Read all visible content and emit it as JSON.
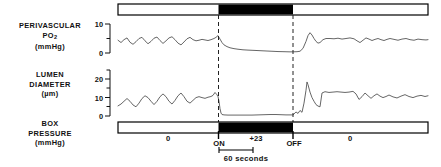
{
  "figure": {
    "type": "multi-panel-physiological-recording",
    "width": 441,
    "height": 167,
    "background": "#ffffff",
    "trace_color": "#555555",
    "bar_fill_on": "#000000",
    "bar_fill_off": "#ffffff",
    "bar_stroke": "#000000"
  },
  "panels": {
    "po2": {
      "label_line1": "PERIVASCULAR",
      "label_line2_main": "PO",
      "label_line2_sub": "2",
      "label_line3": "(mmHg)",
      "axis_ticks": [
        "10",
        "0"
      ],
      "axis_max": 10,
      "axis_min": 0
    },
    "lumen": {
      "label_line1": "LUMEN",
      "label_line2": "DIAMETER",
      "label_line3": "(µm)",
      "axis_ticks": [
        "20",
        "10",
        "0"
      ],
      "axis_max": 25,
      "axis_min": 0
    },
    "box": {
      "label_line1": "BOX",
      "label_line2": "PRESSURE",
      "label_line3": "(mmHg)",
      "segment_values": [
        "0",
        "+23",
        "0"
      ]
    }
  },
  "markers": {
    "on_label": "ON",
    "off_label": "OFF",
    "scale_label": "60  seconds"
  },
  "chart_data": {
    "type": "line",
    "title": "",
    "xlabel": "time",
    "ylabel": "",
    "grid": false,
    "legend": "none",
    "event_on_x": 218,
    "event_off_x": 293,
    "plot_x_start": 118,
    "plot_x_end": 428,
    "series": [
      {
        "name": "Perivascular PO2 (mmHg)",
        "ylim": [
          0,
          10
        ],
        "ytick_values": [
          0,
          10
        ],
        "points": [
          [
            118,
            4.4
          ],
          [
            121,
            3.6
          ],
          [
            124,
            4.6
          ],
          [
            127,
            5.2
          ],
          [
            130,
            3.7
          ],
          [
            133,
            3.0
          ],
          [
            136,
            3.9
          ],
          [
            139,
            5.0
          ],
          [
            142,
            5.4
          ],
          [
            145,
            4.2
          ],
          [
            148,
            3.2
          ],
          [
            151,
            4.0
          ],
          [
            154,
            5.1
          ],
          [
            157,
            5.5
          ],
          [
            160,
            4.3
          ],
          [
            163,
            3.3
          ],
          [
            166,
            4.2
          ],
          [
            169,
            5.2
          ],
          [
            172,
            5.6
          ],
          [
            175,
            4.6
          ],
          [
            178,
            3.4
          ],
          [
            181,
            2.8
          ],
          [
            184,
            3.8
          ],
          [
            187,
            4.9
          ],
          [
            190,
            5.4
          ],
          [
            193,
            4.6
          ],
          [
            196,
            4.2
          ],
          [
            199,
            4.4
          ],
          [
            202,
            4.7
          ],
          [
            205,
            4.5
          ],
          [
            208,
            4.3
          ],
          [
            211,
            4.6
          ],
          [
            214,
            5.0
          ],
          [
            216,
            5.4
          ],
          [
            218,
            6.0
          ],
          [
            220,
            4.8
          ],
          [
            222,
            3.6
          ],
          [
            224,
            2.8
          ],
          [
            227,
            2.2
          ],
          [
            230,
            1.8
          ],
          [
            234,
            1.5
          ],
          [
            238,
            1.3
          ],
          [
            243,
            1.1
          ],
          [
            248,
            1.0
          ],
          [
            254,
            0.9
          ],
          [
            260,
            0.8
          ],
          [
            266,
            0.7
          ],
          [
            272,
            0.6
          ],
          [
            278,
            0.5
          ],
          [
            284,
            0.45
          ],
          [
            289,
            0.4
          ],
          [
            293,
            0.4
          ],
          [
            297,
            0.45
          ],
          [
            300,
            0.6
          ],
          [
            303,
            1.6
          ],
          [
            306,
            4.0
          ],
          [
            308,
            6.0
          ],
          [
            310,
            7.0
          ],
          [
            312,
            6.2
          ],
          [
            314,
            5.0
          ],
          [
            316,
            4.0
          ],
          [
            318,
            3.4
          ],
          [
            320,
            3.6
          ],
          [
            323,
            4.6
          ],
          [
            326,
            5.0
          ],
          [
            330,
            5.0
          ],
          [
            334,
            4.9
          ],
          [
            338,
            5.1
          ],
          [
            342,
            4.8
          ],
          [
            346,
            5.0
          ],
          [
            350,
            5.2
          ],
          [
            354,
            4.9
          ],
          [
            357,
            4.2
          ],
          [
            360,
            3.6
          ],
          [
            363,
            4.4
          ],
          [
            366,
            5.2
          ],
          [
            369,
            4.8
          ],
          [
            372,
            4.3
          ],
          [
            375,
            4.7
          ],
          [
            378,
            5.0
          ],
          [
            381,
            4.6
          ],
          [
            384,
            4.3
          ],
          [
            387,
            4.7
          ],
          [
            390,
            5.0
          ],
          [
            394,
            4.7
          ],
          [
            398,
            4.4
          ],
          [
            402,
            4.8
          ],
          [
            406,
            5.0
          ],
          [
            410,
            4.6
          ],
          [
            414,
            4.4
          ],
          [
            418,
            4.8
          ],
          [
            422,
            4.6
          ],
          [
            426,
            4.5
          ],
          [
            428,
            4.6
          ]
        ]
      },
      {
        "name": "Lumen Diameter (µm)",
        "ylim": [
          0,
          25
        ],
        "ytick_values": [
          0,
          10,
          20
        ],
        "points": [
          [
            118,
            5.5
          ],
          [
            121,
            6.5
          ],
          [
            124,
            8.0
          ],
          [
            127,
            9.5
          ],
          [
            130,
            8.0
          ],
          [
            133,
            6.0
          ],
          [
            136,
            5.0
          ],
          [
            139,
            7.0
          ],
          [
            142,
            9.5
          ],
          [
            145,
            11.0
          ],
          [
            148,
            10.0
          ],
          [
            151,
            8.0
          ],
          [
            154,
            6.2
          ],
          [
            157,
            8.0
          ],
          [
            160,
            10.5
          ],
          [
            163,
            12.0
          ],
          [
            166,
            10.5
          ],
          [
            169,
            8.0
          ],
          [
            172,
            6.5
          ],
          [
            175,
            8.5
          ],
          [
            178,
            11.0
          ],
          [
            181,
            12.5
          ],
          [
            184,
            10.5
          ],
          [
            187,
            8.0
          ],
          [
            190,
            7.0
          ],
          [
            193,
            8.5
          ],
          [
            196,
            10.0
          ],
          [
            199,
            10.5
          ],
          [
            202,
            10.0
          ],
          [
            205,
            9.6
          ],
          [
            208,
            10.2
          ],
          [
            211,
            10.6
          ],
          [
            213,
            11.2
          ],
          [
            215,
            12.8
          ],
          [
            217,
            11.5
          ],
          [
            218,
            10.5
          ],
          [
            219,
            8.0
          ],
          [
            220,
            4.0
          ],
          [
            221,
            1.6
          ],
          [
            222,
            0.8
          ],
          [
            224,
            0.6
          ],
          [
            228,
            0.5
          ],
          [
            233,
            0.5
          ],
          [
            239,
            0.5
          ],
          [
            245,
            0.5
          ],
          [
            252,
            0.5
          ],
          [
            258,
            0.6
          ],
          [
            264,
            0.7
          ],
          [
            270,
            0.8
          ],
          [
            276,
            0.8
          ],
          [
            281,
            0.7
          ],
          [
            286,
            0.6
          ],
          [
            290,
            0.6
          ],
          [
            293,
            0.6
          ],
          [
            296,
            2.2
          ],
          [
            298,
            1.4
          ],
          [
            300,
            3.0
          ],
          [
            302,
            2.0
          ],
          [
            304,
            7.0
          ],
          [
            306,
            14.0
          ],
          [
            307,
            18.5
          ],
          [
            308,
            17.0
          ],
          [
            310,
            13.0
          ],
          [
            312,
            10.0
          ],
          [
            314,
            8.0
          ],
          [
            316,
            6.2
          ],
          [
            318,
            5.4
          ],
          [
            320,
            5.0
          ],
          [
            322,
            12.5
          ],
          [
            325,
            13.2
          ],
          [
            329,
            12.8
          ],
          [
            333,
            13.0
          ],
          [
            337,
            13.2
          ],
          [
            341,
            13.0
          ],
          [
            345,
            12.8
          ],
          [
            349,
            13.0
          ],
          [
            353,
            13.4
          ],
          [
            356,
            12.0
          ],
          [
            359,
            9.0
          ],
          [
            362,
            10.5
          ],
          [
            365,
            12.5
          ],
          [
            368,
            11.0
          ],
          [
            371,
            9.6
          ],
          [
            374,
            11.0
          ],
          [
            377,
            12.0
          ],
          [
            380,
            10.8
          ],
          [
            383,
            10.0
          ],
          [
            386,
            10.6
          ],
          [
            389,
            11.4
          ],
          [
            393,
            10.4
          ],
          [
            397,
            9.8
          ],
          [
            401,
            10.8
          ],
          [
            405,
            11.6
          ],
          [
            409,
            10.6
          ],
          [
            413,
            10.0
          ],
          [
            417,
            10.8
          ],
          [
            421,
            11.2
          ],
          [
            425,
            10.6
          ],
          [
            428,
            11.0
          ]
        ]
      }
    ]
  }
}
